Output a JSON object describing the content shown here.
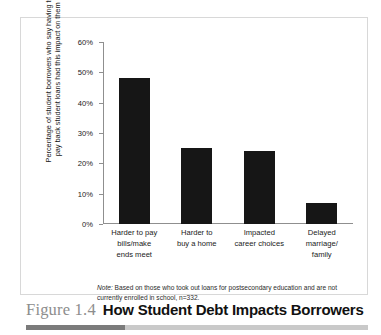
{
  "figure": {
    "number_label": "Figure 1.4",
    "title": "How Student Debt Impacts Borrowers",
    "note_lead": "Note:",
    "note_text": " Based on those who took out loans for postsecondary education and are not currently enrolled in school, n=332."
  },
  "colors": {
    "bar": "#161616",
    "axis": "#8f8f8f",
    "frame": "#d8d8d8",
    "caption_number": "#8d8d8d",
    "caption_title": "#111111",
    "rule_dark": "#7b7b7b",
    "rule_light": "#c9c9c9"
  },
  "chart_data": {
    "type": "bar",
    "title": "How Student Debt Impacts Borrowers",
    "xlabel": "",
    "ylabel": "Percentage of student borrowers who say having to pay back student loans had this impact on them",
    "categories": [
      "Harder to pay bills/make ends meet",
      "Harder to buy a home",
      "Impacted career choices",
      "Delayed marriage/family"
    ],
    "category_lines": [
      [
        "Harder to pay",
        "bills/make",
        "ends meet"
      ],
      [
        "Harder to",
        "buy a home"
      ],
      [
        "Impacted",
        "career choices"
      ],
      [
        "Delayed",
        "marriage/",
        "family"
      ]
    ],
    "values": [
      48,
      25,
      24,
      7
    ],
    "ylim": [
      0,
      60
    ],
    "ytick_values": [
      0,
      10,
      20,
      30,
      40,
      50,
      60
    ],
    "ytick_labels": [
      "0%",
      "10%",
      "20%",
      "30%",
      "40%",
      "50%",
      "60%"
    ],
    "grid": false,
    "legend": false
  }
}
